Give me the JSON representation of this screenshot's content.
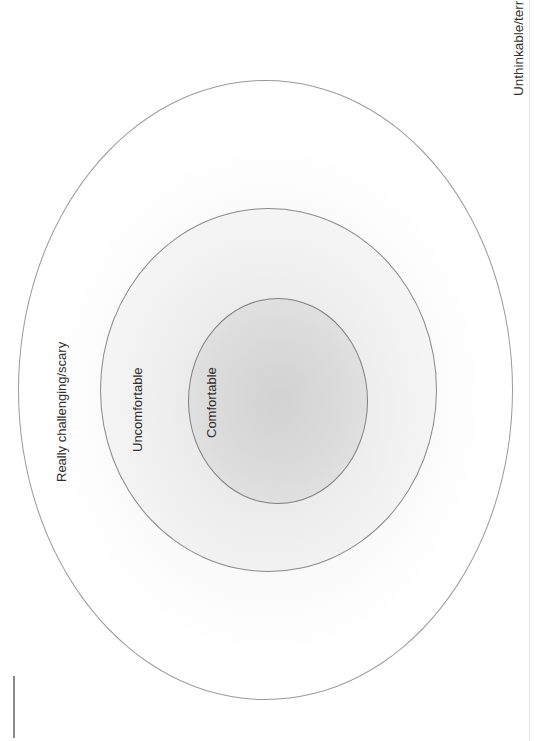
{
  "diagram": {
    "type": "concentric-zones",
    "title": "",
    "zones": [
      {
        "id": "outside",
        "label": "Unthinkable/terrifying"
      },
      {
        "id": "outer",
        "label": "Really challenging/scary"
      },
      {
        "id": "middle",
        "label": "Uncomfortable"
      },
      {
        "id": "inner",
        "label": "Comfortable"
      }
    ]
  },
  "colors": {
    "line": "#9a9a9a",
    "text": "#2e2e2e",
    "center_shade": "#d2d2d2"
  }
}
